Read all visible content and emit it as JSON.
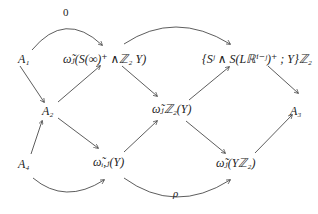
{
  "diagram": {
    "type": "commutative-diagram",
    "nodes": {
      "A1": "A₁",
      "top_left": "ω̃ⱼ(S(∞)⁺ ∧ℤ₂ Y)",
      "top_right": "{Sʲ ∧ S(Lℝⁱ⁻ʲ)⁺ ; Y}ℤ₂",
      "A2": "A₂",
      "mid": "ω̃ⱼℤ₂(Y)",
      "A3": "A₃",
      "A4": "A₄",
      "bot_left": "ω̃ᵢ,ⱼ(Y)",
      "bot_right": "ω̃ⱼ(Yℤ₂)"
    },
    "edge_labels": {
      "zero": "0",
      "rho": "ρ"
    },
    "edges": [
      {
        "from": "A1",
        "to": "top_left",
        "label": "0",
        "curved": true
      },
      {
        "from": "top_left",
        "to": "top_right",
        "curved": true
      },
      {
        "from": "A1",
        "to": "A2"
      },
      {
        "from": "A2",
        "to": "top_left"
      },
      {
        "from": "top_left",
        "to": "mid"
      },
      {
        "from": "mid",
        "to": "top_right"
      },
      {
        "from": "top_right",
        "to": "A3"
      },
      {
        "from": "A2",
        "to": "bot_left"
      },
      {
        "from": "A4",
        "to": "A2"
      },
      {
        "from": "A4",
        "to": "bot_left",
        "curved": true
      },
      {
        "from": "bot_left",
        "to": "mid"
      },
      {
        "from": "mid",
        "to": "bot_right"
      },
      {
        "from": "bot_left",
        "to": "bot_right",
        "label": "ρ",
        "curved": true
      },
      {
        "from": "bot_right",
        "to": "A3"
      }
    ]
  }
}
